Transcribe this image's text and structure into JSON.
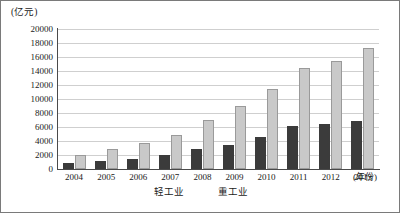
{
  "chart_data": {
    "type": "bar",
    "title": "",
    "xlabel": "(年份)",
    "ylabel": "(亿元)",
    "categories": [
      "2004",
      "2005",
      "2006",
      "2007",
      "2008",
      "2009",
      "2010",
      "2011",
      "2012",
      "2013"
    ],
    "series": [
      {
        "name": "轻工业",
        "color": "#3b3b3b",
        "values": [
          800,
          1100,
          1500,
          2000,
          2900,
          3500,
          4600,
          6100,
          6400,
          6900
        ]
      },
      {
        "name": "重工业",
        "color": "#c9c9c9",
        "values": [
          2000,
          2800,
          3700,
          4900,
          7000,
          9000,
          11400,
          14400,
          15400,
          17300
        ]
      }
    ],
    "ylim": [
      0,
      20000
    ],
    "ytick_labels": [
      "20000",
      "18000",
      "16000",
      "14000",
      "12000",
      "10000",
      "8000",
      "6000",
      "4000",
      "2000",
      "0"
    ],
    "ytick_values": [
      20000,
      18000,
      16000,
      14000,
      12000,
      10000,
      8000,
      6000,
      4000,
      2000,
      0
    ],
    "grid": true,
    "legend_position": "below-axis"
  }
}
